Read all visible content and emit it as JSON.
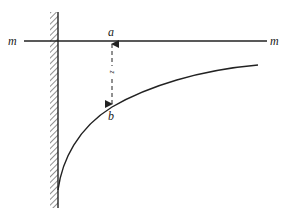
{
  "diagram": {
    "type": "physics-diagram",
    "labels": {
      "line_left": "m",
      "line_right": "m",
      "point_a": "a",
      "point_b": "b",
      "distance": "z"
    },
    "colors": {
      "stroke": "#222222",
      "background": "#ffffff"
    },
    "geometry": {
      "wall_x": 58,
      "wall_top": 12,
      "wall_bottom": 208,
      "line_y": 41,
      "line_x_start": 24,
      "line_x_end": 267,
      "point_a": [
        112,
        41
      ],
      "point_b": [
        112,
        107
      ],
      "curve_start": [
        58,
        190
      ],
      "curve_end": [
        258,
        65
      ]
    }
  }
}
